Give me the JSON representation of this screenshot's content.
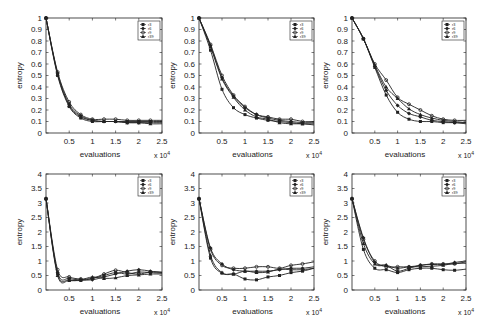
{
  "chart_data": [
    {
      "type": "line",
      "panel": "top-left",
      "xlabel": "evaluations",
      "ylabel": "entropy",
      "xmultiplier": "x 10^4",
      "xlim": [
        0,
        2.5
      ],
      "ylim": [
        0,
        1
      ],
      "xticks": [
        0.5,
        1,
        1.5,
        2,
        2.5
      ],
      "yticks": [
        0,
        0.1,
        0.2,
        0.3,
        0.4,
        0.5,
        0.6,
        0.7,
        0.8,
        0.9,
        1
      ],
      "legend": [
        "r3",
        "r6",
        "r9",
        "r39"
      ],
      "legend_position": "top-right",
      "x": [
        0,
        0.25,
        0.5,
        0.75,
        1.0,
        1.25,
        1.5,
        1.75,
        2.0,
        2.25,
        2.5
      ],
      "series": [
        {
          "name": "r3",
          "values": [
            1.0,
            0.5,
            0.23,
            0.13,
            0.1,
            0.1,
            0.1,
            0.1,
            0.1,
            0.1,
            0.1
          ]
        },
        {
          "name": "r6",
          "values": [
            1.0,
            0.52,
            0.25,
            0.15,
            0.11,
            0.1,
            0.1,
            0.09,
            0.09,
            0.09,
            0.09
          ]
        },
        {
          "name": "r9",
          "values": [
            1.0,
            0.53,
            0.27,
            0.16,
            0.12,
            0.12,
            0.12,
            0.11,
            0.11,
            0.11,
            0.11
          ]
        },
        {
          "name": "r39",
          "values": [
            1.0,
            0.51,
            0.24,
            0.14,
            0.11,
            0.1,
            0.1,
            0.09,
            0.09,
            0.08,
            0.08
          ]
        }
      ]
    },
    {
      "type": "line",
      "panel": "top-middle",
      "xlabel": "evaluations",
      "ylabel": "entropy",
      "xmultiplier": "x 10^4",
      "xlim": [
        0,
        2.5
      ],
      "ylim": [
        0,
        1
      ],
      "xticks": [
        0.5,
        1,
        1.5,
        2,
        2.5
      ],
      "yticks": [
        0,
        0.1,
        0.2,
        0.3,
        0.4,
        0.5,
        0.6,
        0.7,
        0.8,
        0.9,
        1
      ],
      "legend": [
        "r3",
        "r6",
        "r9",
        "r39"
      ],
      "legend_position": "top-right",
      "x": [
        0,
        0.25,
        0.5,
        0.75,
        1.0,
        1.25,
        1.5,
        1.75,
        2.0,
        2.25,
        2.5
      ],
      "series": [
        {
          "name": "r3",
          "values": [
            1.0,
            0.72,
            0.38,
            0.22,
            0.16,
            0.13,
            0.11,
            0.1,
            0.09,
            0.08,
            0.08
          ]
        },
        {
          "name": "r6",
          "values": [
            1.0,
            0.76,
            0.48,
            0.32,
            0.22,
            0.16,
            0.13,
            0.11,
            0.1,
            0.09,
            0.09
          ]
        },
        {
          "name": "r9",
          "values": [
            1.0,
            0.77,
            0.5,
            0.33,
            0.23,
            0.16,
            0.14,
            0.12,
            0.12,
            0.1,
            0.1
          ]
        },
        {
          "name": "r39",
          "values": [
            1.0,
            0.75,
            0.47,
            0.31,
            0.2,
            0.14,
            0.12,
            0.09,
            0.08,
            0.08,
            0.07
          ]
        }
      ]
    },
    {
      "type": "line",
      "panel": "top-right",
      "xlabel": "evaluations",
      "ylabel": "entropy",
      "xmultiplier": "x 10^4",
      "xlim": [
        0,
        2.5
      ],
      "ylim": [
        0,
        1
      ],
      "xticks": [
        0.5,
        1,
        1.5,
        2,
        2.5
      ],
      "yticks": [
        0,
        0.1,
        0.2,
        0.3,
        0.4,
        0.5,
        0.6,
        0.7,
        0.8,
        0.9,
        1
      ],
      "legend": [
        "r3",
        "r6",
        "r9",
        "r39"
      ],
      "legend_position": "top-right",
      "x": [
        0,
        0.25,
        0.5,
        0.75,
        1.0,
        1.25,
        1.5,
        1.75,
        2.0,
        2.25,
        2.5
      ],
      "series": [
        {
          "name": "r3",
          "values": [
            1.0,
            0.82,
            0.57,
            0.33,
            0.18,
            0.12,
            0.1,
            0.1,
            0.09,
            0.09,
            0.08
          ]
        },
        {
          "name": "r6",
          "values": [
            1.0,
            0.82,
            0.58,
            0.37,
            0.24,
            0.17,
            0.14,
            0.11,
            0.1,
            0.09,
            0.09
          ]
        },
        {
          "name": "r9",
          "values": [
            1.0,
            0.82,
            0.6,
            0.46,
            0.31,
            0.25,
            0.2,
            0.15,
            0.12,
            0.11,
            0.11
          ]
        },
        {
          "name": "r39",
          "values": [
            1.0,
            0.82,
            0.59,
            0.4,
            0.3,
            0.21,
            0.16,
            0.13,
            0.11,
            0.1,
            0.09
          ]
        }
      ]
    },
    {
      "type": "line",
      "panel": "bottom-left",
      "xlabel": "evaluations",
      "ylabel": "entropy",
      "xmultiplier": "x 10^4",
      "xlim": [
        0,
        2.5
      ],
      "ylim": [
        0,
        4
      ],
      "xticks": [
        0.5,
        1,
        1.5,
        2,
        2.5
      ],
      "yticks": [
        0,
        0.5,
        1,
        1.5,
        2,
        2.5,
        3,
        3.5,
        4
      ],
      "legend": [
        "r3",
        "r6",
        "r9",
        "r39"
      ],
      "legend_position": "top-right",
      "x": [
        0,
        0.25,
        0.5,
        0.75,
        1.0,
        1.25,
        1.5,
        1.75,
        2.0,
        2.25,
        2.5
      ],
      "series": [
        {
          "name": "r3",
          "values": [
            3.15,
            0.55,
            0.35,
            0.33,
            0.4,
            0.5,
            0.6,
            0.55,
            0.62,
            0.6,
            0.58
          ]
        },
        {
          "name": "r6",
          "values": [
            3.15,
            0.6,
            0.4,
            0.35,
            0.35,
            0.45,
            0.55,
            0.65,
            0.7,
            0.65,
            0.6
          ]
        },
        {
          "name": "r9",
          "values": [
            3.15,
            0.7,
            0.45,
            0.38,
            0.4,
            0.55,
            0.68,
            0.6,
            0.55,
            0.62,
            0.62
          ]
        },
        {
          "name": "r39",
          "values": [
            3.15,
            0.5,
            0.33,
            0.35,
            0.45,
            0.4,
            0.42,
            0.5,
            0.52,
            0.55,
            0.55
          ]
        }
      ]
    },
    {
      "type": "line",
      "panel": "bottom-middle",
      "xlabel": "evaluations",
      "ylabel": "entropy",
      "xmultiplier": "x 10^4",
      "xlim": [
        0,
        2.5
      ],
      "ylim": [
        0,
        4
      ],
      "xticks": [
        0.5,
        1,
        1.5,
        2,
        2.5
      ],
      "yticks": [
        0,
        0.5,
        1,
        1.5,
        2,
        2.5,
        3,
        3.5,
        4
      ],
      "legend": [
        "r3",
        "r6",
        "r9",
        "r39"
      ],
      "legend_position": "top-right",
      "x": [
        0,
        0.25,
        0.5,
        0.75,
        1.0,
        1.25,
        1.5,
        1.75,
        2.0,
        2.25,
        2.5
      ],
      "series": [
        {
          "name": "r3",
          "values": [
            3.15,
            1.1,
            0.58,
            0.55,
            0.38,
            0.35,
            0.45,
            0.5,
            0.6,
            0.65,
            0.75
          ]
        },
        {
          "name": "r6",
          "values": [
            3.15,
            1.45,
            0.9,
            0.7,
            0.65,
            0.65,
            0.65,
            0.7,
            0.75,
            0.75,
            0.8
          ]
        },
        {
          "name": "r9",
          "values": [
            3.15,
            1.4,
            0.85,
            0.75,
            0.75,
            0.8,
            0.8,
            0.75,
            0.85,
            0.9,
            0.97
          ]
        },
        {
          "name": "r39",
          "values": [
            3.15,
            1.2,
            0.6,
            0.55,
            0.65,
            0.6,
            0.62,
            0.72,
            0.7,
            0.7,
            0.75
          ]
        }
      ]
    },
    {
      "type": "line",
      "panel": "bottom-right",
      "xlabel": "evaluations",
      "ylabel": "entropy",
      "xmultiplier": "x 10^4",
      "xlim": [
        0,
        2.5
      ],
      "ylim": [
        0,
        4
      ],
      "xticks": [
        0.5,
        1,
        1.5,
        2,
        2.5
      ],
      "yticks": [
        0,
        0.5,
        1,
        1.5,
        2,
        2.5,
        3,
        3.5,
        4
      ],
      "legend": [
        "r3",
        "r6",
        "r9",
        "r39"
      ],
      "legend_position": "top-right",
      "x": [
        0,
        0.25,
        0.5,
        0.75,
        1.0,
        1.25,
        1.5,
        1.75,
        2.0,
        2.25,
        2.5
      ],
      "series": [
        {
          "name": "r3",
          "values": [
            3.15,
            1.4,
            0.75,
            0.7,
            0.6,
            0.7,
            0.75,
            0.75,
            0.7,
            0.68,
            0.72
          ]
        },
        {
          "name": "r6",
          "values": [
            3.15,
            1.8,
            0.95,
            0.85,
            0.65,
            0.75,
            0.85,
            0.88,
            0.88,
            0.95,
            1.0
          ]
        },
        {
          "name": "r9",
          "values": [
            3.15,
            1.75,
            1.0,
            0.8,
            0.8,
            0.8,
            0.85,
            0.9,
            0.9,
            0.9,
            0.97
          ]
        },
        {
          "name": "r39",
          "values": [
            3.15,
            1.6,
            0.9,
            0.85,
            0.75,
            0.8,
            0.8,
            0.82,
            0.85,
            0.92,
            0.92
          ]
        }
      ]
    }
  ],
  "panels": [
    {
      "x": 46,
      "y": 18,
      "w": 116,
      "h": 115
    },
    {
      "x": 199,
      "y": 18,
      "w": 115,
      "h": 115
    },
    {
      "x": 352,
      "y": 18,
      "w": 114,
      "h": 115
    },
    {
      "x": 46,
      "y": 174,
      "w": 116,
      "h": 116
    },
    {
      "x": 199,
      "y": 174,
      "w": 115,
      "h": 116
    },
    {
      "x": 352,
      "y": 174,
      "w": 114,
      "h": 116
    }
  ],
  "colors": {
    "line": "#222222",
    "axis": "#222222",
    "background": "#ffffff"
  }
}
